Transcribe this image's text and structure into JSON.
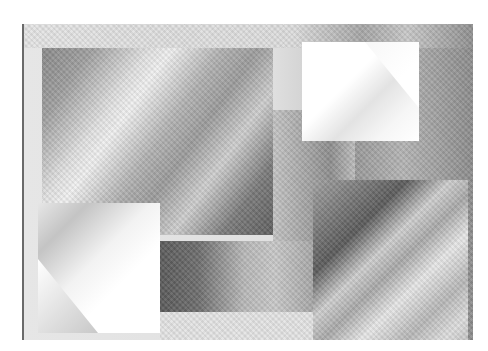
{
  "artwork": {
    "description": "Abstract grayscale composition of overlapping gradient rectangles",
    "palette": {
      "white": "#ffffff",
      "light_gray": "#e4e4e4",
      "mid_gray": "#a6a6a6",
      "dark_gray": "#5a5a5a",
      "frame_edge": "#6a6a6a"
    },
    "shapes": [
      {
        "name": "large-diagonal-gradient-rectangle",
        "tone": "diagonal banded gray"
      },
      {
        "name": "top-right-white-rectangle",
        "tone": "white with diagonal corner fold"
      },
      {
        "name": "bottom-left-white-rectangle",
        "tone": "white with diagonal corner fold"
      },
      {
        "name": "lower-middle-dark-band",
        "tone": "dark to light horizontal gradient"
      },
      {
        "name": "bottom-right-diagonal-rectangle",
        "tone": "diagonal dark and light stripes"
      },
      {
        "name": "middle-vertical-column",
        "tone": "mid gray"
      },
      {
        "name": "right-vertical-column",
        "tone": "mid gray"
      }
    ]
  }
}
